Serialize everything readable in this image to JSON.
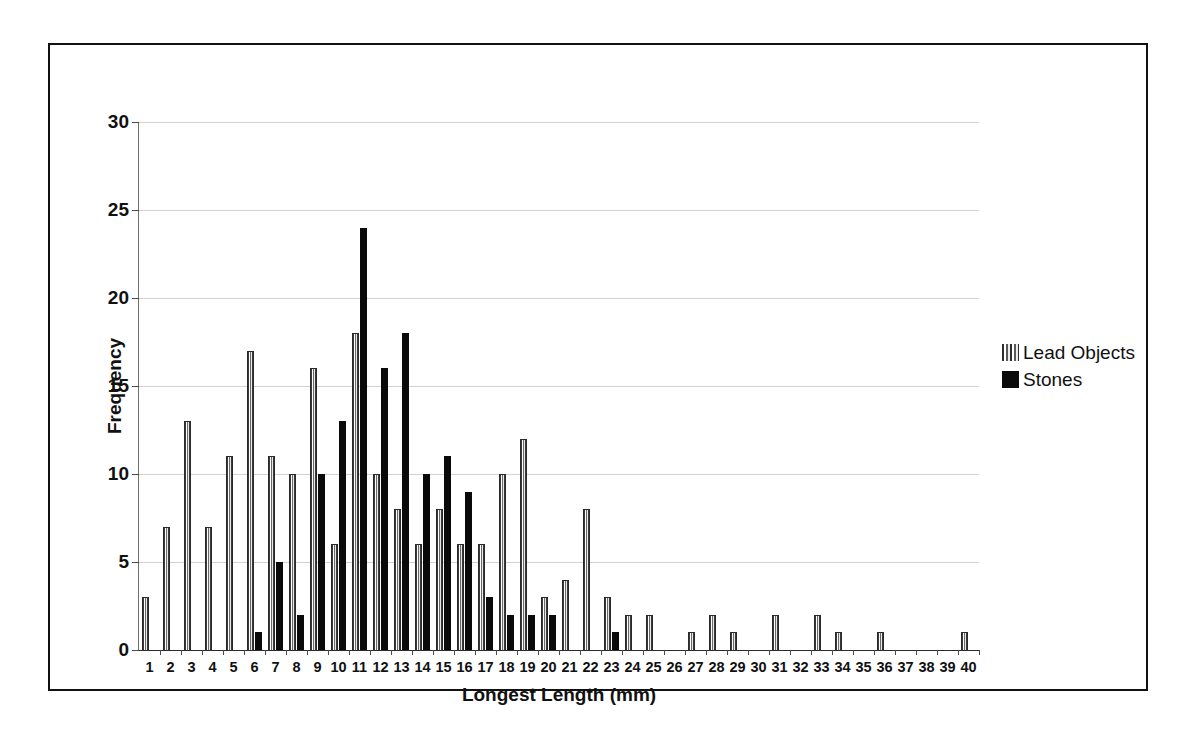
{
  "chart_data": {
    "type": "bar",
    "title": "",
    "xlabel": "Longest Length (mm)",
    "ylabel": "Frequency",
    "ylim": [
      0,
      30
    ],
    "ytick_values": [
      0,
      5,
      10,
      15,
      20,
      25,
      30
    ],
    "ytick_labels": [
      "0",
      "5",
      "10",
      "15",
      "20",
      "25",
      "30"
    ],
    "grid": true,
    "legend_position": "right",
    "categories": [
      1,
      2,
      3,
      4,
      5,
      6,
      7,
      8,
      9,
      10,
      11,
      12,
      13,
      14,
      15,
      16,
      17,
      18,
      19,
      20,
      21,
      22,
      23,
      24,
      25,
      26,
      27,
      28,
      29,
      30,
      31,
      32,
      33,
      34,
      35,
      36,
      37,
      38,
      39,
      40
    ],
    "xtick_labels": [
      "1",
      "2",
      "3",
      "4",
      "5",
      "6",
      "7",
      "8",
      "9",
      "10",
      "11",
      "12",
      "13",
      "14",
      "15",
      "16",
      "17",
      "18",
      "19",
      "20",
      "21",
      "22",
      "23",
      "24",
      "25",
      "26",
      "27",
      "28",
      "29",
      "30",
      "31",
      "32",
      "33",
      "34",
      "35",
      "36",
      "37",
      "38",
      "39",
      "40"
    ],
    "series": [
      {
        "name": "Lead Objects",
        "color": "#c9c9c9",
        "pattern": "vertical-hatch",
        "values": [
          3,
          7,
          13,
          7,
          11,
          17,
          11,
          10,
          16,
          6,
          18,
          10,
          8,
          6,
          8,
          6,
          6,
          10,
          12,
          3,
          4,
          8,
          3,
          2,
          2,
          0,
          1,
          2,
          1,
          0,
          2,
          0,
          2,
          1,
          0,
          1,
          0,
          0,
          0,
          1
        ]
      },
      {
        "name": "Stones",
        "color": "#0a0a0a",
        "pattern": "solid",
        "values": [
          0,
          0,
          0,
          0,
          0,
          1,
          5,
          2,
          10,
          13,
          24,
          16,
          18,
          10,
          11,
          9,
          3,
          2,
          2,
          2,
          0,
          0,
          1,
          0,
          0,
          0,
          0,
          0,
          0,
          0,
          0,
          0,
          0,
          0,
          0,
          0,
          0,
          0,
          0,
          0
        ]
      }
    ]
  },
  "legend": {
    "items": [
      {
        "label": "Lead Objects",
        "swatch": "lead"
      },
      {
        "label": "Stones",
        "swatch": "stone"
      }
    ]
  }
}
